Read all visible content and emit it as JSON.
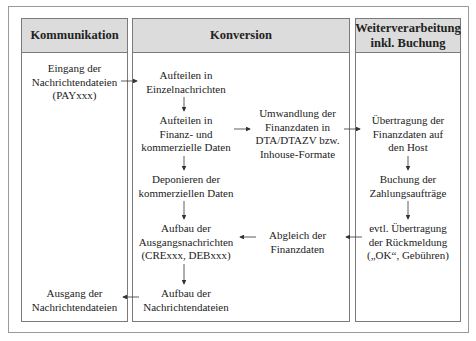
{
  "columns": [
    {
      "title": "Kommunikation"
    },
    {
      "title": "Konversion"
    },
    {
      "title": "Weiterverarbeitung\ninkl. Buchung"
    }
  ],
  "nodes": {
    "eingang": "Eingang der\nNachrichtendateien\n(PAYxxx)",
    "ausgang": "Ausgang der\nNachrichtendateien",
    "aufteilen_einzel": "Aufteilen in\nEinzelnachrichten",
    "aufteilen_finanz": "Aufteilen in\nFinanz- und\nkommerzielle Daten",
    "deponieren": "Deponieren der\nkommerziellen Daten",
    "aufbau_ausgang": "Aufbau der\nAusgangsnachrichten\n(CRExxx, DEBxxx)",
    "aufbau_dateien": "Aufbau der\nNachrichtendateien",
    "umwandlung": "Umwandlung der\nFinanzdaten in\nDTA/DTAZV bzw.\nInhouse-Formate",
    "abgleich": "Abgleich der\nFinanzdaten",
    "uebertragung_host": "Übertragung der\nFinanzdaten auf\nden Host",
    "buchung": "Buchung der\nZahlungsaufträge",
    "rueckmeldung": "evtl. Übertragung\nder Rückmeldung\n(„OK“, Gebühren)"
  },
  "colors": {
    "header_bg": "#dcdcdc",
    "border": "#7a7a7a",
    "arrow": "#333333"
  }
}
